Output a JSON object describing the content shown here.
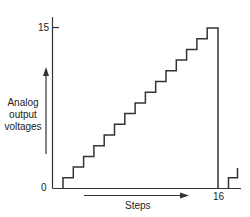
{
  "diagram": {
    "type": "staircase-waveform",
    "y_axis": {
      "label_lines": [
        "Analog",
        "output",
        "voltages"
      ],
      "tick_top": "15",
      "tick_bottom": "0"
    },
    "x_axis": {
      "label": "Steps",
      "tick_end": "16"
    },
    "levels": 16,
    "colors": {
      "line": "#333333",
      "text": "#222222",
      "background": "#ffffff"
    }
  }
}
